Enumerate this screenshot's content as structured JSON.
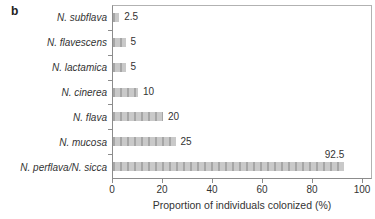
{
  "panel": {
    "label": "b"
  },
  "chart_data": {
    "type": "bar",
    "orientation": "horizontal",
    "title": "",
    "categories": [
      "N. subflava",
      "N. flavescens",
      "N. lactamica",
      "N. cinerea",
      "N. flava",
      "N. mucosa",
      "N. perflava/N. sicca"
    ],
    "values": [
      2.5,
      5,
      5,
      10,
      20,
      25,
      92.5
    ],
    "value_labels": [
      "2.5",
      "5",
      "5",
      "10",
      "20",
      "25",
      "92.5"
    ],
    "value_label_above": [
      false,
      false,
      false,
      false,
      false,
      false,
      true
    ],
    "xlabel": "Proportion of individuals colonized (%)",
    "ylabel": "",
    "x_ticks": [
      0,
      20,
      40,
      60,
      80,
      100
    ],
    "xlim": [
      0,
      104
    ],
    "grid": false,
    "legend": false,
    "bar_color": "#c9c9c9",
    "bar_stripe_color": "#a6a6a6",
    "axis_color": "#8c8c8c",
    "frame_color": "#b2b2b2",
    "text_color": "#333333"
  },
  "layout_numbers": {
    "px_per_unit": 2.5,
    "plot_left": 112,
    "plot_top": 5,
    "plot_width": 260,
    "plot_height": 174
  }
}
